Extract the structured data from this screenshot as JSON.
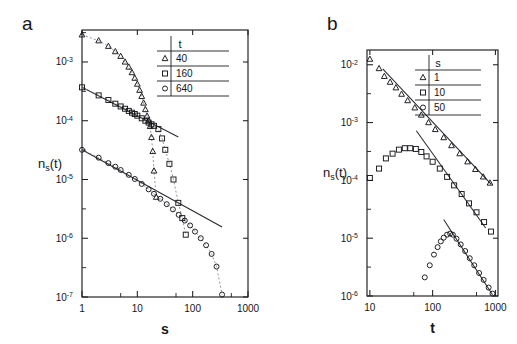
{
  "figure": {
    "panel_labels": {
      "a": "a",
      "b": "b"
    },
    "background_color": "#ffffff",
    "ink_color": "#15161a"
  },
  "chart_data": [
    {
      "id": "panel-a",
      "panel": "a",
      "type": "scatter",
      "title": "",
      "xlabel": "s",
      "ylabel": "n_s(t)",
      "ylabel_display": "ns(t)",
      "xscale": "log",
      "yscale": "log",
      "xlim": [
        1,
        1000
      ],
      "ylim": [
        1e-07,
        0.0035
      ],
      "xticks": [
        1,
        10,
        100,
        1000
      ],
      "xtick_labels": [
        "1",
        "10",
        "100",
        "1000"
      ],
      "yticks": [
        0.001,
        0.0001,
        1e-05,
        1e-06,
        1e-07
      ],
      "ytick_labels": [
        "10-3",
        "10-4",
        "10-5",
        "10-6",
        "10-7"
      ],
      "ytick_mantissa": "10",
      "ytick_exponents": [
        "-3",
        "-4",
        "-5",
        "-6",
        "-7"
      ],
      "grid": false,
      "legend_position": "top-right",
      "legend_header": "t",
      "series": [
        {
          "name": "t = 40",
          "legend_value": "40",
          "marker": "triangle",
          "connector": "dotted",
          "x": [
            1,
            2,
            3,
            4,
            5,
            6,
            7,
            8,
            9,
            10,
            11,
            12,
            13,
            14,
            15,
            16,
            17,
            18,
            19,
            20,
            22
          ],
          "y": [
            0.0029,
            0.0023,
            0.00185,
            0.0015,
            0.00125,
            0.001,
            0.00082,
            0.00066,
            0.00053,
            0.00042,
            0.00033,
            0.00026,
            0.0002,
            0.000155,
            0.00012,
            0.0001,
            8e-05,
            5.2e-05,
            3e-05,
            1.4e-05,
            5e-06
          ]
        },
        {
          "name": "t = 160",
          "legend_value": "160",
          "marker": "square",
          "connector": "dotted",
          "x": [
            1,
            2,
            3,
            4,
            5,
            6,
            7,
            8,
            9,
            10,
            12,
            14,
            16,
            18,
            20,
            24,
            28,
            32,
            38,
            45,
            55,
            65,
            75
          ],
          "y": [
            0.00037,
            0.00027,
            0.000225,
            0.000195,
            0.000175,
            0.00016,
            0.000147,
            0.000137,
            0.00013,
            0.000122,
            0.00011,
            0.0001,
            9.3e-05,
            8.7e-05,
            8.2e-05,
            7.2e-05,
            5e-05,
            3.2e-05,
            1.85e-05,
            1e-05,
            4e-06,
            2.2e-06,
            1.15e-06
          ]
        },
        {
          "name": "t = 640",
          "legend_value": "640",
          "marker": "circle",
          "connector": "dotted",
          "x": [
            1,
            2,
            3,
            4,
            5,
            7,
            9,
            12,
            16,
            20,
            26,
            34,
            44,
            56,
            72,
            90,
            110,
            140,
            175,
            220,
            270,
            340
          ],
          "y": [
            3.2e-05,
            2.35e-05,
            1.9e-05,
            1.65e-05,
            1.45e-05,
            1.2e-05,
            1.02e-05,
            8.4e-06,
            6.8e-06,
            5.7e-06,
            4.7e-06,
            3.8e-06,
            3.1e-06,
            2.5e-06,
            2e-06,
            1.65e-06,
            1.3e-06,
            1e-06,
            7.6e-07,
            5.4e-07,
            3.3e-07,
            1.1e-07
          ]
        }
      ],
      "fit_lines": [
        {
          "name": "power-law fit upper",
          "x": [
            1,
            55
          ],
          "y": [
            0.00037,
            5.3e-05
          ],
          "slope": -0.48
        },
        {
          "name": "power-law fit lower",
          "x": [
            1,
            340
          ],
          "y": [
            3.2e-05,
            1.55e-06
          ],
          "slope": -0.52
        }
      ]
    },
    {
      "id": "panel-b",
      "panel": "b",
      "type": "scatter",
      "title": "",
      "xlabel": "t",
      "ylabel": "n_s(t)",
      "ylabel_display": "ns(t)",
      "xscale": "log",
      "yscale": "log",
      "xlim": [
        9,
        1100
      ],
      "ylim": [
        1e-06,
        0.018
      ],
      "xticks": [
        10,
        100,
        1000
      ],
      "xtick_labels": [
        "10",
        "100",
        "1000"
      ],
      "yticks": [
        0.01,
        0.001,
        0.0001,
        1e-05,
        1e-06
      ],
      "ytick_labels": [
        "10-2",
        "10-3",
        "10-4",
        "10-5",
        "10-6"
      ],
      "ytick_mantissa": "10",
      "ytick_exponents": [
        "-2",
        "-3",
        "-4",
        "-5",
        "-6"
      ],
      "grid": false,
      "legend_position": "top-right",
      "legend_header": "s",
      "series": [
        {
          "name": "s = 1",
          "legend_value": "1",
          "marker": "triangle",
          "connector": "none",
          "x": [
            10,
            14,
            17,
            21,
            26,
            32,
            40,
            52,
            66,
            86,
            110,
            150,
            200,
            270,
            360,
            480,
            640,
            820
          ],
          "y": [
            0.0125,
            0.0086,
            0.0063,
            0.005,
            0.004,
            0.0031,
            0.0024,
            0.0018,
            0.00135,
            0.001,
            0.00076,
            0.00055,
            0.0004,
            0.00029,
            0.00021,
            0.000155,
            0.000115,
            9e-05
          ]
        },
        {
          "name": "s = 10",
          "legend_value": "10",
          "marker": "square",
          "connector": "none",
          "x": [
            10,
            14,
            18,
            23,
            29,
            36,
            44,
            54,
            66,
            80,
            100,
            130,
            170,
            220,
            290,
            380,
            500,
            660,
            850
          ],
          "y": [
            0.00011,
            0.00016,
            0.00024,
            0.00029,
            0.00034,
            0.00036,
            0.00036,
            0.00035,
            0.00031,
            0.00026,
            0.00021,
            0.00016,
            0.000115,
            8.2e-05,
            5.8e-05,
            4e-05,
            2.8e-05,
            1.9e-05,
            1.3e-05
          ]
        },
        {
          "name": "s = 50",
          "legend_value": "50",
          "marker": "circle",
          "connector": "none",
          "x": [
            75,
            90,
            105,
            120,
            135,
            150,
            170,
            190,
            210,
            240,
            280,
            330,
            390,
            460,
            550,
            650,
            780,
            900
          ],
          "y": [
            2.1e-06,
            3.4e-06,
            5.2e-06,
            7e-06,
            8.8e-06,
            1.02e-05,
            1.15e-05,
            1.2e-05,
            1.15e-05,
            9.8e-06,
            7.8e-06,
            6e-06,
            4.5e-06,
            3.4e-06,
            2.5e-06,
            1.9e-06,
            1.4e-06,
            1.1e-06
          ]
        }
      ],
      "fit_lines": [
        {
          "name": "power-law fit s=1",
          "x": [
            16,
            860
          ],
          "y": [
            0.0085,
            8.5e-05
          ],
          "slope": -1.15
        },
        {
          "name": "power-law fit s=10",
          "x": [
            55,
            700
          ],
          "y": [
            0.00072,
            1.5e-05
          ],
          "slope": -1.52
        },
        {
          "name": "power-law fit s=50",
          "x": [
            150,
            900
          ],
          "y": [
            2.1e-05,
            1.05e-06
          ],
          "slope": -1.67
        }
      ]
    }
  ]
}
